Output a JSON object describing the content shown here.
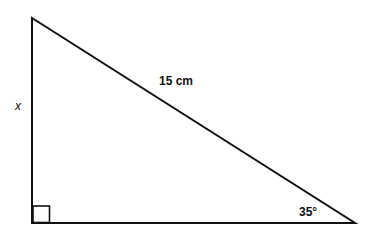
{
  "diagram": {
    "type": "right-triangle",
    "labels": {
      "hypotenuse": "15 cm",
      "angle": "35°",
      "opposite_side": "x"
    },
    "right_angle_marker": true,
    "colors": {
      "stroke": "#111111",
      "background": "#ffffff"
    }
  }
}
